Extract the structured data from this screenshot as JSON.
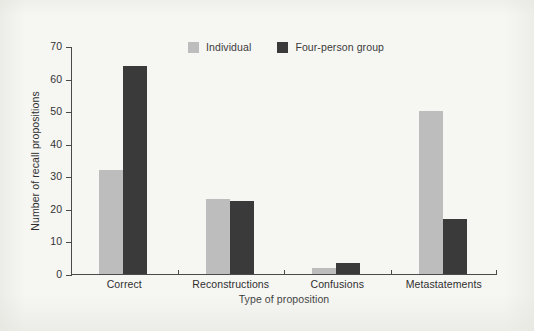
{
  "chart_data": {
    "type": "bar",
    "title": "",
    "xlabel": "Type of proposition",
    "ylabel": "Number of recall propositions",
    "categories": [
      "Correct",
      "Reconstructions",
      "Confusions",
      "Metastatements"
    ],
    "series": [
      {
        "name": "Individual",
        "color": "#bdbdbd",
        "values": [
          32,
          23,
          2,
          50
        ]
      },
      {
        "name": "Four-person group",
        "color": "#3a3a3a",
        "values": [
          64,
          22.5,
          3.5,
          17
        ]
      }
    ],
    "ylim": [
      0,
      70
    ],
    "ytick_labels": [
      "0",
      "10",
      "20",
      "30",
      "40",
      "50",
      "60",
      "70"
    ],
    "ytick_values": [
      0,
      10,
      20,
      30,
      40,
      50,
      60,
      70
    ],
    "grid": false,
    "legend_position": "top-center"
  },
  "legend": {
    "entries": [
      {
        "label": "Individual",
        "color": "#bdbdbd"
      },
      {
        "label": "Four-person group",
        "color": "#3a3a3a"
      }
    ]
  },
  "axes": {
    "x_title": "Type of proposition",
    "y_title": "Number of recall propositions"
  }
}
